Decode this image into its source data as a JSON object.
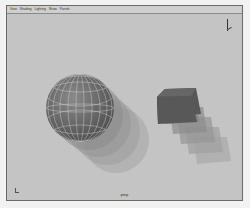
{
  "menubar": {
    "items": [
      {
        "label": "View"
      },
      {
        "label": "Shading"
      },
      {
        "label": "Lighting"
      },
      {
        "label": "Show"
      },
      {
        "label": "Panels"
      }
    ]
  },
  "viewport": {
    "camera_label": "persp",
    "background": "#c4c4c4",
    "objects": [
      {
        "type": "sphere",
        "name": "wireframe-sphere",
        "color": "#7a7a7a",
        "wire_color": "#d8d8d8"
      },
      {
        "type": "cube",
        "name": "cube",
        "color": "#555555"
      }
    ],
    "motion_trails": {
      "sphere_copies": 4,
      "cube_copies": 5
    }
  },
  "gizmos": {
    "view_cube_icon": "axis-indicator-top-right",
    "axis_icon": "axis-indicator-bottom-left"
  }
}
